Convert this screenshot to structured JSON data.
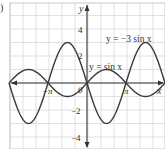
{
  "part_label": ")",
  "chart_data": {
    "type": "line",
    "title": "",
    "xlabel": "x",
    "ylabel": "y",
    "xlim": [
      -6.283,
      6.283
    ],
    "ylim": [
      -4.5,
      5.5
    ],
    "grid": true,
    "x_tick_labels": [
      "-π",
      "0",
      "π"
    ],
    "x_ticks": [
      -3.1416,
      0,
      3.1416
    ],
    "y_tick_labels": [
      "4",
      "2",
      "-2",
      "-4"
    ],
    "y_ticks": [
      4,
      2,
      -2,
      -4
    ],
    "series": [
      {
        "name": "y = sin x",
        "function": "sin(x)",
        "amplitude": 1,
        "x": [
          -6.283,
          -4.712,
          -3.142,
          -1.571,
          0,
          1.571,
          3.142,
          4.712,
          6.283
        ],
        "values": [
          0,
          1,
          0,
          -1,
          0,
          1,
          0,
          -1,
          0
        ]
      },
      {
        "name": "y = −3 sin x",
        "function": "-3*sin(x)",
        "amplitude": 3,
        "x": [
          -6.283,
          -4.712,
          -3.142,
          -1.571,
          0,
          1.571,
          3.142,
          4.712,
          6.283
        ],
        "values": [
          0,
          -3,
          0,
          3,
          0,
          -3,
          0,
          3,
          0
        ]
      }
    ],
    "annotations": [
      {
        "text": "y = −3 sin x",
        "near_series": "y = −3 sin x"
      },
      {
        "text": "y = sin x",
        "near_series": "y = sin x"
      }
    ],
    "legend": "none (inline labels)"
  },
  "labels": {
    "y_axis": "y",
    "x_axis": "x",
    "origin": "0",
    "neg_pi": "−π",
    "pi": "π",
    "y4": "4",
    "y2": "2",
    "yneg2": "−2",
    "yneg4": "−4",
    "curve1": "y = −3 sin x",
    "curve2": "y = sin x"
  }
}
